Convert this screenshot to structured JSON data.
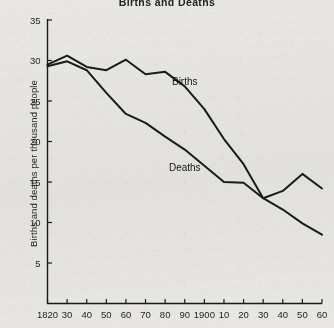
{
  "chart_data": {
    "type": "line",
    "title": "Births and Deaths",
    "xlabel": "",
    "ylabel": "Births and deaths per thousand people",
    "x": [
      1820,
      1830,
      1840,
      1850,
      1860,
      1870,
      1880,
      1890,
      1900,
      1910,
      1920,
      1930,
      1940,
      1950,
      1960
    ],
    "xtick_labels": [
      "1820",
      "30",
      "40",
      "50",
      "60",
      "70",
      "80",
      "90",
      "1900",
      "10",
      "20",
      "30",
      "40",
      "50",
      "60"
    ],
    "ytick_labels": [
      "5",
      "10",
      "15",
      "20",
      "25",
      "30",
      "35"
    ],
    "ytick_values": [
      5,
      10,
      15,
      20,
      25,
      30,
      35
    ],
    "xlim": [
      1820,
      1960
    ],
    "ylim": [
      0,
      35
    ],
    "grid": false,
    "legend": "inline-annotations",
    "series": [
      {
        "name": "Births",
        "label": "Births",
        "color": "#1a1a16",
        "values": [
          29.5,
          30.6,
          29.2,
          28.8,
          30.1,
          28.3,
          28.6,
          26.8,
          24.0,
          20.3,
          17.2,
          13.0,
          13.9,
          16.0,
          14.2
        ]
      },
      {
        "name": "Deaths",
        "label": "Deaths",
        "color": "#1a1a16",
        "values": [
          29.3,
          29.9,
          28.8,
          26.0,
          23.4,
          22.3,
          20.6,
          19.0,
          17.0,
          15.0,
          14.9,
          13.0,
          11.6,
          9.9,
          8.5
        ]
      }
    ],
    "annotations": [
      {
        "text": "Births",
        "x": 1890,
        "y": 27.0
      },
      {
        "text": "Deaths",
        "x": 1890,
        "y": 16.4
      }
    ]
  }
}
